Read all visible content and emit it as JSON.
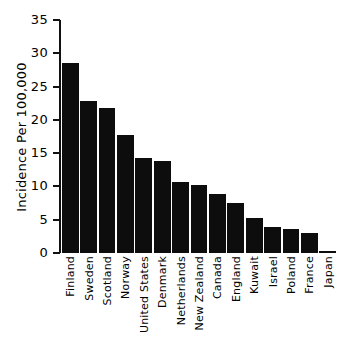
{
  "chart_data": {
    "type": "bar",
    "title": "",
    "subtitle": "",
    "xlabel": "",
    "ylabel": "Incidence Per 100,000",
    "ylim": [
      0,
      35
    ],
    "ytick_labels": [
      "35",
      "30",
      "25",
      "20",
      "15",
      "10",
      "5",
      "0"
    ],
    "ytick_values": [
      35,
      30,
      25,
      20,
      15,
      10,
      5,
      0
    ],
    "grid": false,
    "legend": null,
    "bar_color": "#0d0d0d",
    "background_color": "#ffffff",
    "axis_color": "#111111",
    "categories": [
      "Finland",
      "Sweden",
      "Scotland",
      "Norway",
      "United States",
      "Denmark",
      "Netherlands",
      "New Zealand",
      "Canada",
      "England",
      "Kuwait",
      "Israel",
      "Poland",
      "France",
      "Japan"
    ],
    "values": [
      28.6,
      22.8,
      21.8,
      17.7,
      14.2,
      13.8,
      10.6,
      10.2,
      8.8,
      7.5,
      5.2,
      3.9,
      3.6,
      3.0,
      0.3
    ]
  }
}
